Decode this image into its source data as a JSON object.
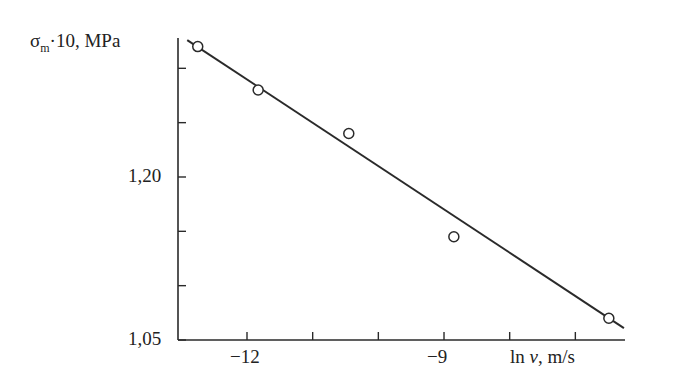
{
  "chart_data": {
    "type": "scatter",
    "title": "",
    "xlabel": "ln v, m/s",
    "ylabel": "σm·10, MPa",
    "ylabel_parts": {
      "symbol": "σ",
      "subscript": "m",
      "rest": "·10, MPa"
    },
    "xlabel_parts": {
      "pre": "ln ",
      "var": "v",
      "rest": ", m/s"
    },
    "xlim": [
      -13.05,
      -6.24
    ],
    "ylim": [
      1.05,
      1.328
    ],
    "x_ticks": [
      -12,
      -11,
      -10,
      -9,
      -8,
      -7
    ],
    "x_tick_labels": {
      "-12": "−12",
      "-9": "−9"
    },
    "y_ticks": [
      1.05,
      1.1,
      1.15,
      1.2,
      1.25,
      1.3
    ],
    "y_tick_labels": {
      "1.05": "1,05",
      "1.2": "1,20"
    },
    "grid": false,
    "legend": null,
    "series": [
      {
        "name": "measured",
        "marker": "open-circle",
        "x": [
          -12.75,
          -11.83,
          -10.45,
          -8.85,
          -6.49
        ],
        "y": [
          1.32,
          1.28,
          1.24,
          1.145,
          1.07
        ]
      },
      {
        "name": "linear-fit",
        "style": "line",
        "x": [
          -12.91,
          -6.26
        ],
        "y": [
          1.326,
          1.061
        ]
      }
    ]
  },
  "colors": {
    "ink": "#2a2a2a",
    "background": "#ffffff"
  }
}
